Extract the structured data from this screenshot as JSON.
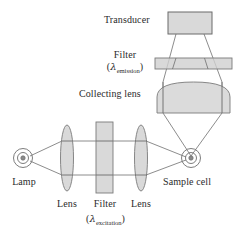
{
  "figure": {
    "kind": "optical-diagram",
    "background_color": "#ffffff",
    "stroke_color": "#6e6e6e",
    "fill_color": "#cfcfcf",
    "text_color": "#2b2b2b"
  },
  "labels": {
    "transducer": "Transducer",
    "filter_emission": "Filter",
    "filter_emission_sub_open": "(",
    "filter_emission_lambda": "λ",
    "filter_emission_sub": "emission",
    "filter_emission_sub_close": ")",
    "collecting_lens": "Collecting lens",
    "lamp": "Lamp",
    "lens_left": "Lens",
    "filter_excitation": "Filter",
    "filter_excitation_lambda": "λ",
    "filter_excitation_sub": "excitation",
    "lens_right": "Lens",
    "sample_cell": "Sample cell"
  },
  "components": [
    {
      "id": "lamp",
      "name": "Lamp",
      "shape": "concentric-circles",
      "cx": 23,
      "cy": 158,
      "radii": [
        9.5,
        5.5,
        2.2
      ]
    },
    {
      "id": "lens-excitation-1",
      "name": "Lens",
      "shape": "ellipse",
      "cx": 67,
      "cy": 158,
      "rx": 6.5,
      "ry": 33
    },
    {
      "id": "filter-excitation",
      "name": "Filter (lambda excitation)",
      "shape": "rectangle",
      "x": 96,
      "y": 122,
      "width": 17,
      "height": 71
    },
    {
      "id": "lens-excitation-2",
      "name": "Lens",
      "shape": "ellipse",
      "cx": 141,
      "cy": 158,
      "rx": 6.5,
      "ry": 33
    },
    {
      "id": "sample-cell",
      "name": "Sample cell",
      "shape": "concentric-circles",
      "cx": 191,
      "cy": 158,
      "radii": [
        9.5,
        5.5,
        2.2
      ]
    },
    {
      "id": "collecting-lens",
      "name": "Collecting lens",
      "shape": "plano-convex-lens",
      "x": 157,
      "y": 82,
      "width": 73,
      "height": 31
    },
    {
      "id": "filter-emission",
      "name": "Filter (lambda emission)",
      "shape": "rectangle",
      "x": 155,
      "y": 58,
      "width": 77,
      "height": 11
    },
    {
      "id": "transducer",
      "name": "Transducer",
      "shape": "rectangle",
      "x": 168,
      "y": 12,
      "width": 44,
      "height": 22
    }
  ],
  "light_paths": {
    "excitation": {
      "source": [
        23,
        158
      ],
      "collimated_top_y": 141,
      "collimated_bottom_y": 175,
      "focus": [
        191,
        158
      ]
    },
    "emission": {
      "source": [
        191,
        158
      ],
      "detector": [
        190,
        33
      ],
      "spread_left_x": 163,
      "spread_right_x": 222
    }
  }
}
